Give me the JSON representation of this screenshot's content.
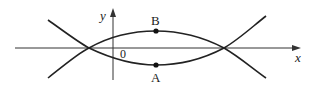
{
  "diagram": {
    "type": "coordinate-curves",
    "axes": {
      "x_label": "x",
      "y_label": "y",
      "origin_label": "0"
    },
    "points": [
      {
        "label": "B",
        "x": 156,
        "y": 31
      },
      {
        "label": "A",
        "x": 156,
        "y": 65
      }
    ],
    "curves": [
      {
        "name": "upper-arc",
        "description": "curve passing through B, crossing x-axis at two points"
      },
      {
        "name": "lower-arc",
        "description": "curve passing through A, crossing x-axis at two points"
      }
    ],
    "colors": {
      "stroke": "#222222",
      "axis": "#333333",
      "background": "#ffffff"
    }
  }
}
